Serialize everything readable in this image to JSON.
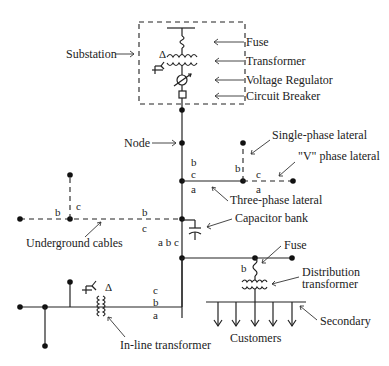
{
  "diagram": {
    "labels": {
      "substation": "Substation",
      "fuse_top": "Fuse",
      "transformer": "Transformer",
      "voltage_regulator": "Voltage Regulator",
      "circuit_breaker": "Circuit Breaker",
      "node": "Node",
      "single_phase_lateral": "Single-phase lateral",
      "v_phase_lateral": "\"V\" phase lateral",
      "three_phase_lateral": "Three-phase lateral",
      "capacitor_bank": "Capacitor bank",
      "underground_cables": "Underground cables",
      "fuse_bottom": "Fuse",
      "distribution_transformer_1": "Distribution",
      "distribution_transformer_2": "transformer",
      "secondary": "Secondary",
      "customers": "Customers",
      "inline_transformer": "In-line transformer"
    },
    "phases": {
      "three_phase_b": "b",
      "three_phase_c": "c",
      "three_phase_a": "a",
      "single_b": "b",
      "v_c": "c",
      "v_a": "a",
      "ug_left_b": "b",
      "ug_left_c": "c",
      "ug_right_b": "b",
      "ug_right_c": "c",
      "main_abc": "a b c",
      "fuse_b": "b",
      "inline_c": "c",
      "inline_b": "b",
      "inline_a": "a"
    },
    "symbols": {
      "delta": "Δ",
      "wye": "Y"
    }
  }
}
